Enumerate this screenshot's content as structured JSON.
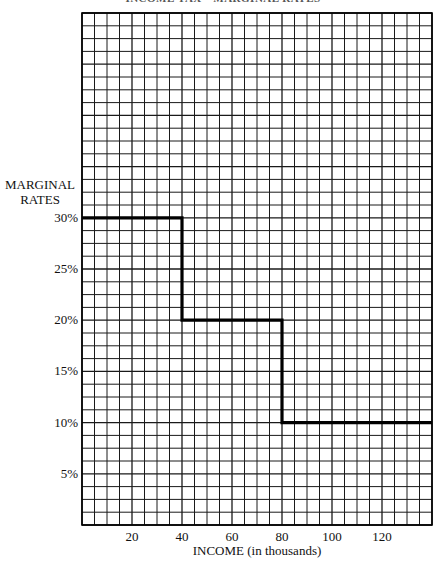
{
  "title": "INCOME TAX—MARGINAL RATES",
  "chart_data": {
    "type": "line",
    "subtype": "step",
    "title": "INCOME TAX—MARGINAL RATES",
    "xlabel": "INCOME (in thousands)",
    "ylabel": "MARGINAL RATES",
    "ylabel_lines": [
      "MARGINAL",
      "RATES"
    ],
    "xlim": [
      0,
      140
    ],
    "ylim": [
      0,
      50
    ],
    "x_ticks": [
      20,
      40,
      60,
      80,
      100,
      120
    ],
    "x_tick_labels": [
      "20",
      "40",
      "60",
      "80",
      "100",
      "120"
    ],
    "y_ticks": [
      5,
      10,
      15,
      20,
      25,
      30
    ],
    "y_tick_labels": [
      "5%",
      "10%",
      "15%",
      "20%",
      "25%",
      "30%"
    ],
    "grid": true,
    "grid_x_step": 5,
    "grid_y_step": 1.25,
    "legend": null,
    "series": [
      {
        "name": "Marginal rate",
        "points": [
          {
            "x": 0,
            "y": 30
          },
          {
            "x": 40,
            "y": 30
          },
          {
            "x": 40,
            "y": 20
          },
          {
            "x": 80,
            "y": 20
          },
          {
            "x": 80,
            "y": 10
          },
          {
            "x": 140,
            "y": 10
          }
        ],
        "brackets": [
          {
            "from": 0,
            "to": 40,
            "rate": 30
          },
          {
            "from": 40,
            "to": 80,
            "rate": 20
          },
          {
            "from": 80,
            "to": 140,
            "rate": 10
          }
        ],
        "color": "#000000"
      }
    ]
  },
  "colors": {
    "grid": "#1a1a1a",
    "line": "#000000",
    "background": "#ffffff"
  }
}
